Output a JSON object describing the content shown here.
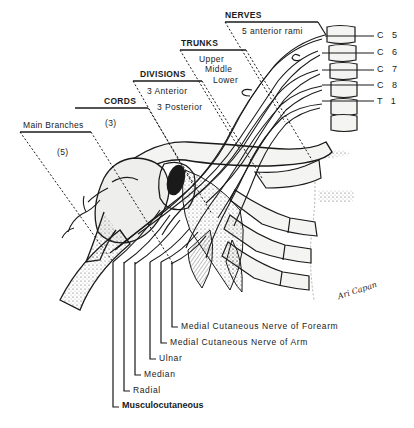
{
  "figure": {
    "signature": "Ari Capan"
  },
  "levels": [
    {
      "key": "nerves",
      "header": "NERVES",
      "lines": [
        "5 anterior rami"
      ]
    },
    {
      "key": "trunks",
      "header": "TRUNKS",
      "lines": [
        "Upper",
        "Middle",
        "Lower"
      ]
    },
    {
      "key": "divisions",
      "header": "DIVISIONS",
      "lines": [
        "3 Anterior",
        "3 Posterior"
      ]
    },
    {
      "key": "cords",
      "header": "CORDS",
      "lines": [
        "(3)"
      ]
    },
    {
      "key": "main_branches",
      "header": "Main Branches",
      "lines": [
        "(5)"
      ]
    }
  ],
  "roots": [
    "C 5",
    "C 6",
    "C 7",
    "C 8",
    "T 1"
  ],
  "branches": [
    "Medial Cutaneous Nerve of Forearm",
    "Medial Cutaneous  Nerve  of  Arm",
    "Ulnar",
    "Median",
    "Radial",
    "Musculocutaneous"
  ],
  "colors": {
    "ink": "#1a1a1a",
    "bone_fill": "#f4f4f2",
    "shade": "#5a5a5a",
    "background": "#ffffff"
  }
}
